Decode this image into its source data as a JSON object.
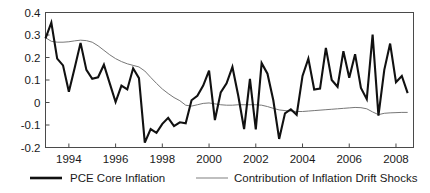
{
  "chart_data": {
    "type": "line",
    "title": "",
    "xlabel": "",
    "ylabel": "",
    "xlim": [
      1993.0,
      2008.75
    ],
    "ylim": [
      -0.2,
      0.4
    ],
    "grid": false,
    "legend_position": "bottom",
    "y_ticks": [
      "0.4",
      "0.3",
      "0.2",
      "0.1",
      "0",
      "-0.1",
      "-0.2"
    ],
    "y_tick_values": [
      0.4,
      0.3,
      0.2,
      0.1,
      0.0,
      -0.1,
      -0.2
    ],
    "x_ticks": [
      "1994",
      "1996",
      "1998",
      "2000",
      "2002",
      "2004",
      "2006",
      "2008"
    ],
    "x_tick_values": [
      1994,
      1996,
      1998,
      2000,
      2002,
      2004,
      2006,
      2008
    ],
    "x": [
      1993.0,
      1993.25,
      1993.5,
      1993.75,
      1994.0,
      1994.25,
      1994.5,
      1994.75,
      1995.0,
      1995.25,
      1995.5,
      1995.75,
      1996.0,
      1996.25,
      1996.5,
      1996.75,
      1997.0,
      1997.25,
      1997.5,
      1997.75,
      1998.0,
      1998.25,
      1998.5,
      1998.75,
      1999.0,
      1999.25,
      1999.5,
      1999.75,
      2000.0,
      2000.25,
      2000.5,
      2000.75,
      2001.0,
      2001.25,
      2001.5,
      2001.75,
      2002.0,
      2002.25,
      2002.5,
      2002.75,
      2003.0,
      2003.25,
      2003.5,
      2003.75,
      2004.0,
      2004.25,
      2004.5,
      2004.75,
      2005.0,
      2005.25,
      2005.5,
      2005.75,
      2006.0,
      2006.25,
      2006.5,
      2006.75,
      2007.0,
      2007.25,
      2007.5,
      2007.75,
      2008.0,
      2008.25,
      2008.5
    ],
    "series": [
      {
        "name": "PCE Core Inflation",
        "color": "#111111",
        "width": "thick",
        "values": [
          0.285,
          0.355,
          0.195,
          0.165,
          0.048,
          0.155,
          0.265,
          0.145,
          0.105,
          0.112,
          0.168,
          0.085,
          0.002,
          0.075,
          0.058,
          0.152,
          0.108,
          -0.178,
          -0.118,
          -0.135,
          -0.095,
          -0.068,
          -0.105,
          -0.088,
          -0.092,
          0.01,
          0.03,
          0.075,
          0.142,
          -0.078,
          0.045,
          0.085,
          0.158,
          0.03,
          -0.118,
          0.105,
          -0.12,
          0.175,
          0.128,
          0.01,
          -0.162,
          -0.048,
          -0.03,
          -0.055,
          0.118,
          0.195,
          0.058,
          0.062,
          0.243,
          0.1,
          0.07,
          0.228,
          0.11,
          0.215,
          0.065,
          0.015,
          0.302,
          -0.058,
          0.145,
          0.262,
          0.09,
          0.118,
          0.042
        ]
      },
      {
        "name": "Contribution of Inflation Drift Shocks",
        "color": "#777777",
        "width": "thin",
        "values": [
          0.288,
          0.272,
          0.268,
          0.268,
          0.27,
          0.274,
          0.277,
          0.275,
          0.268,
          0.252,
          0.232,
          0.212,
          0.195,
          0.182,
          0.172,
          0.165,
          0.158,
          0.14,
          0.112,
          0.085,
          0.06,
          0.04,
          0.022,
          0.008,
          -0.012,
          -0.016,
          -0.01,
          -0.004,
          -0.002,
          -0.006,
          -0.01,
          -0.012,
          -0.012,
          -0.01,
          -0.01,
          -0.01,
          -0.01,
          -0.012,
          -0.018,
          -0.026,
          -0.033,
          -0.036,
          -0.038,
          -0.04,
          -0.04,
          -0.038,
          -0.036,
          -0.034,
          -0.032,
          -0.03,
          -0.028,
          -0.026,
          -0.024,
          -0.022,
          -0.023,
          -0.028,
          -0.042,
          -0.054,
          -0.048,
          -0.046,
          -0.045,
          -0.044,
          -0.044
        ]
      }
    ]
  },
  "legend": {
    "items": [
      {
        "label": "PCE Core Inflation"
      },
      {
        "label": "Contribution of Inflation Drift Shocks"
      }
    ]
  }
}
